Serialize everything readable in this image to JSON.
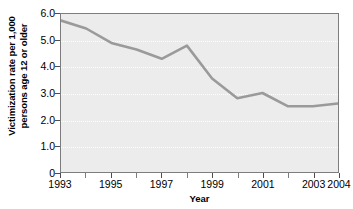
{
  "chart_data": {
    "type": "line",
    "title": "",
    "xlabel": "Year",
    "ylabel": "Victimization rate per 1,000 persons age 12 or older",
    "ylabel_line1": "Victimization rate per 1,000",
    "ylabel_line2": "persons age 12 or older",
    "x": [
      1993,
      1994,
      1995,
      1996,
      1997,
      1998,
      1999,
      2000,
      2001,
      2002,
      2003,
      2004
    ],
    "values": [
      5.75,
      5.45,
      4.9,
      4.65,
      4.3,
      4.8,
      3.55,
      2.8,
      3.0,
      2.5,
      2.5,
      2.6
    ],
    "xlim": [
      1993,
      2004
    ],
    "ylim": [
      0,
      6.0
    ],
    "ytick_values": [
      6.0,
      5.0,
      4.0,
      3.0,
      2.0,
      1.0,
      0
    ],
    "ytick_labels": [
      "6.0",
      "5.0",
      "4.0",
      "3.0",
      "2.0",
      "1.0",
      "0"
    ],
    "xtick_values": [
      1993,
      1995,
      1997,
      1999,
      2001,
      2003,
      2004
    ],
    "xtick_labels": [
      "1993",
      "1995",
      "1997",
      "1999",
      "2001",
      "2003",
      "2004"
    ],
    "xtick_minor_values": [
      1994,
      1996,
      1998,
      2000,
      2002
    ],
    "grid": "horizontal-dotted-white",
    "legend": "none",
    "series_color": "#9a9a9a",
    "plot_background": "#ececec",
    "frame_color": "#7d7d7d"
  }
}
